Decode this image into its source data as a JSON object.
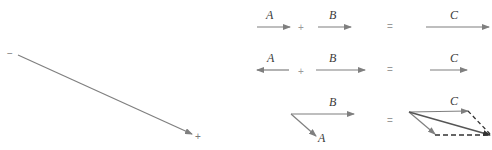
{
  "colors": {
    "vector": "#7f7f7f",
    "label": "#3a3a3a",
    "operator": "#9a9a9a",
    "background": "#ffffff"
  },
  "left_vector": {
    "tail_sign": "−",
    "head_sign": "+"
  },
  "rows": [
    {
      "name": "parallel-addition",
      "a_label": "A",
      "b_label": "B",
      "c_label": "C",
      "plus": "+",
      "equals": "="
    },
    {
      "name": "antiparallel-addition",
      "a_label": "A",
      "b_label": "B",
      "c_label": "C",
      "plus": "+",
      "equals": "="
    },
    {
      "name": "parallelogram-addition",
      "a_label": "A",
      "b_label": "B",
      "c_label": "C",
      "equals": "="
    }
  ]
}
